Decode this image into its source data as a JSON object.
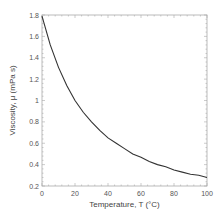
{
  "chart_data": {
    "type": "line",
    "title": "",
    "xlabel": "Temperature, T (°C)",
    "ylabel": "Viscosity, μ (mPa s)",
    "xlim": [
      0,
      100
    ],
    "ylim": [
      0.2,
      1.8
    ],
    "x_ticks": [
      "0",
      "20",
      "40",
      "60",
      "80",
      "100"
    ],
    "y_ticks": [
      "0.2",
      "0.4",
      "0.6",
      "0.8",
      "1",
      "1.2",
      "1.4",
      "1.6",
      "1.8"
    ],
    "grid": false,
    "legend": null,
    "series": [
      {
        "name": "viscosity",
        "color": "#333333",
        "x": [
          0,
          5,
          10,
          15,
          20,
          25,
          30,
          35,
          40,
          45,
          50,
          55,
          60,
          65,
          70,
          75,
          80,
          85,
          90,
          95,
          100
        ],
        "values": [
          1.79,
          1.52,
          1.31,
          1.14,
          1.0,
          0.89,
          0.8,
          0.72,
          0.65,
          0.6,
          0.55,
          0.5,
          0.47,
          0.43,
          0.4,
          0.38,
          0.35,
          0.33,
          0.31,
          0.3,
          0.28
        ]
      }
    ]
  }
}
